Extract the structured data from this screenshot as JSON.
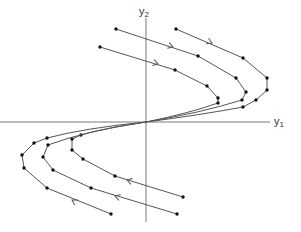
{
  "diagram": {
    "title": "",
    "type": "phase-portrait",
    "axes": {
      "origin": [
        146,
        122
      ],
      "x_axis": {
        "label_main": "y",
        "label_sub": "1",
        "from": [
          0,
          122
        ],
        "to": [
          270,
          122
        ],
        "label_pos": [
          274,
          116
        ]
      },
      "y_axis": {
        "label_main": "y",
        "label_sub": "2",
        "from": [
          146,
          18
        ],
        "to": [
          146,
          222
        ],
        "label_pos": [
          139,
          6
        ]
      }
    },
    "colors": {
      "line": "#555555",
      "dot": "#111111",
      "label": "#333333"
    },
    "trajectories": [
      {
        "name": "upper-outer",
        "points": [
          [
            176,
            29
          ],
          [
            243,
            58
          ],
          [
            267,
            78
          ],
          [
            267,
            90
          ],
          [
            256,
            100
          ],
          [
            243,
            107
          ]
        ],
        "tail": [
          [
            243,
            107
          ],
          [
            200,
            115
          ],
          [
            146,
            122
          ]
        ],
        "arrow": {
          "at": [
            212,
            43
          ],
          "angle": 23
        }
      },
      {
        "name": "upper-middle",
        "points": [
          [
            116,
            29
          ],
          [
            198,
            56
          ],
          [
            236,
            78
          ],
          [
            246,
            92
          ],
          [
            242,
            100
          ]
        ],
        "tail": [
          [
            242,
            100
          ],
          [
            200,
            113
          ],
          [
            146,
            122
          ]
        ],
        "arrow": {
          "at": [
            173,
            47
          ],
          "angle": 18
        }
      },
      {
        "name": "upper-inner",
        "points": [
          [
            100,
            47
          ],
          [
            175,
            70
          ],
          [
            207,
            86
          ],
          [
            218,
            98
          ],
          [
            218,
            103
          ]
        ],
        "tail": [
          [
            218,
            103
          ],
          [
            190,
            113
          ],
          [
            146,
            122
          ]
        ],
        "arrow": {
          "at": [
            158,
            64
          ],
          "angle": 17
        }
      },
      {
        "name": "lower-inner",
        "points": [
          [
            183,
            197
          ],
          [
            115,
            176
          ],
          [
            83,
            159
          ],
          [
            72,
            150
          ],
          [
            72,
            139
          ],
          [
            81,
            135
          ]
        ],
        "tail": [
          [
            81,
            135
          ],
          [
            105,
            128
          ],
          [
            146,
            122
          ]
        ],
        "arrow": {
          "at": [
            127,
            180
          ],
          "angle": 197
        }
      },
      {
        "name": "lower-middle",
        "points": [
          [
            177,
            214
          ],
          [
            91,
            188
          ],
          [
            53,
            170
          ],
          [
            43,
            157
          ],
          [
            48,
            145
          ]
        ],
        "tail": [
          [
            48,
            145
          ],
          [
            85,
            131
          ],
          [
            146,
            122
          ]
        ],
        "arrow": {
          "at": [
            115,
            196
          ],
          "angle": 197
        }
      },
      {
        "name": "lower-outer",
        "points": [
          [
            111,
            214
          ],
          [
            47,
            188
          ],
          [
            24,
            168
          ],
          [
            22,
            155
          ],
          [
            34,
            143
          ],
          [
            47,
            138
          ]
        ],
        "tail": [
          [
            47,
            138
          ],
          [
            85,
            128
          ],
          [
            146,
            122
          ]
        ],
        "arrow": {
          "at": [
            72,
            200
          ],
          "angle": 210
        }
      }
    ]
  }
}
